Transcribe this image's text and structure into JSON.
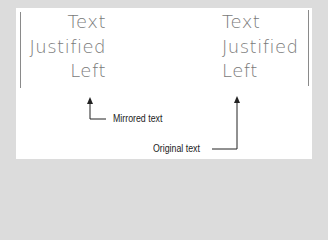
{
  "mirrored_block": {
    "lines": [
      "Text",
      "Justified",
      "Left"
    ],
    "alignment": "right"
  },
  "original_block": {
    "lines": [
      "Text",
      "Justified",
      "Left"
    ],
    "alignment": "left"
  },
  "callouts": {
    "mirrored_label": "Mirrored text",
    "original_label": "Original text"
  },
  "colors": {
    "background": "#dcdcdc",
    "panel": "#ffffff",
    "text": "#7a7a7a",
    "line": "#8a8a8a",
    "arrow": "#222222"
  }
}
